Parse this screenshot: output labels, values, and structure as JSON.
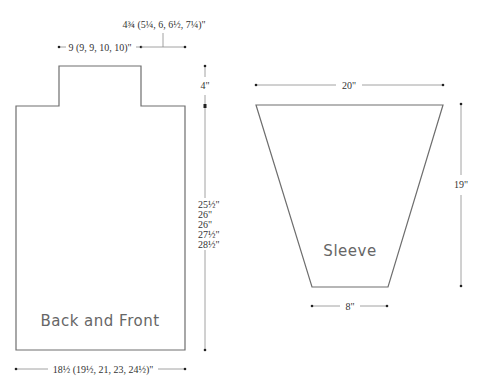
{
  "diagram": {
    "type": "knitting-schematic",
    "pieces": {
      "body": {
        "label": "Back and Front",
        "width_label": "18½ (19½, 21, 23, 24½)\"",
        "neck_width_label": "9 (9, 9, 10, 10)\"",
        "shoulder_width_label": "4¾ (5¼, 6, 6½, 7¼)\"",
        "shoulder_height_label": "4\"",
        "length_labels": [
          "25½\"",
          "26\"",
          "26\"",
          "27½\"",
          "28½\""
        ]
      },
      "sleeve": {
        "label": "Sleeve",
        "top_width_label": "20\"",
        "bottom_width_label": "8\"",
        "length_label": "19\""
      }
    }
  }
}
